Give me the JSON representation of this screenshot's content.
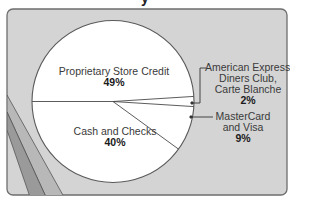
{
  "title_fragment": "y",
  "colors": {
    "card_bg": "#d4d4d4",
    "card_border": "#6e6e6e",
    "pie_fill": "#ffffff",
    "pie_stroke": "#5a5a5a",
    "stripe_dark": "#9a9a9a",
    "stripe_mid": "#b8b8b8"
  },
  "chart_data": {
    "type": "pie",
    "title": "",
    "slices": [
      {
        "label": "Proprietary Store Credit",
        "value": 49
      },
      {
        "label": "American Express, Diners Club, Carte Blanche",
        "value": 2
      },
      {
        "label": "MasterCard and Visa",
        "value": 9
      },
      {
        "label": "Cash and Checks",
        "value": 40
      }
    ],
    "unit": "%"
  },
  "labels": {
    "store_credit": {
      "name": "Proprietary Store Credit",
      "pct": "49%"
    },
    "amex": {
      "line1": "American Express,",
      "line2": "Diners Club,",
      "line3": "Carte Blanche",
      "pct": "2%"
    },
    "mastercard": {
      "line1": "MasterCard",
      "line2": "and Visa",
      "pct": "9%"
    },
    "cash": {
      "name": "Cash and Checks",
      "pct": "40%"
    }
  }
}
